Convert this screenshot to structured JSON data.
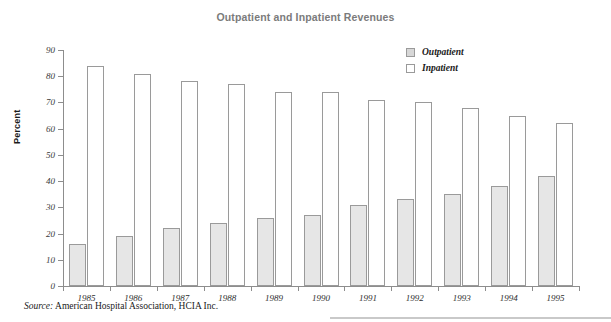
{
  "chart_data": {
    "type": "bar",
    "title": "Outpatient and Inpatient Revenues",
    "xlabel": "",
    "ylabel": "Percent",
    "categories": [
      "1985",
      "1986",
      "1987",
      "1988",
      "1989",
      "1990",
      "1991",
      "1992",
      "1993",
      "1994",
      "1995"
    ],
    "series": [
      {
        "name": "Outpatient",
        "color": "#e6e6e6",
        "values": [
          16,
          19,
          22,
          24,
          26,
          27,
          31,
          33,
          35,
          38,
          42
        ]
      },
      {
        "name": "Inpatient",
        "color": "#ffffff",
        "values": [
          84,
          81,
          78,
          77,
          74,
          74,
          71,
          70,
          68,
          65,
          62
        ]
      }
    ],
    "ylim": [
      0,
      90
    ],
    "ytick_step": 10,
    "yticks": [
      "90",
      "80",
      "70",
      "60",
      "50",
      "40",
      "30",
      "20",
      "10",
      "0"
    ],
    "grid": false,
    "legend_position": "top-right"
  },
  "legend": {
    "items": [
      {
        "label": "Outpatient",
        "swatch": "outpatient"
      },
      {
        "label": "Inpatient",
        "swatch": "inpatient"
      }
    ]
  },
  "source": {
    "label": "Source:",
    "text": "American Hospital Association, HCIA Inc."
  }
}
